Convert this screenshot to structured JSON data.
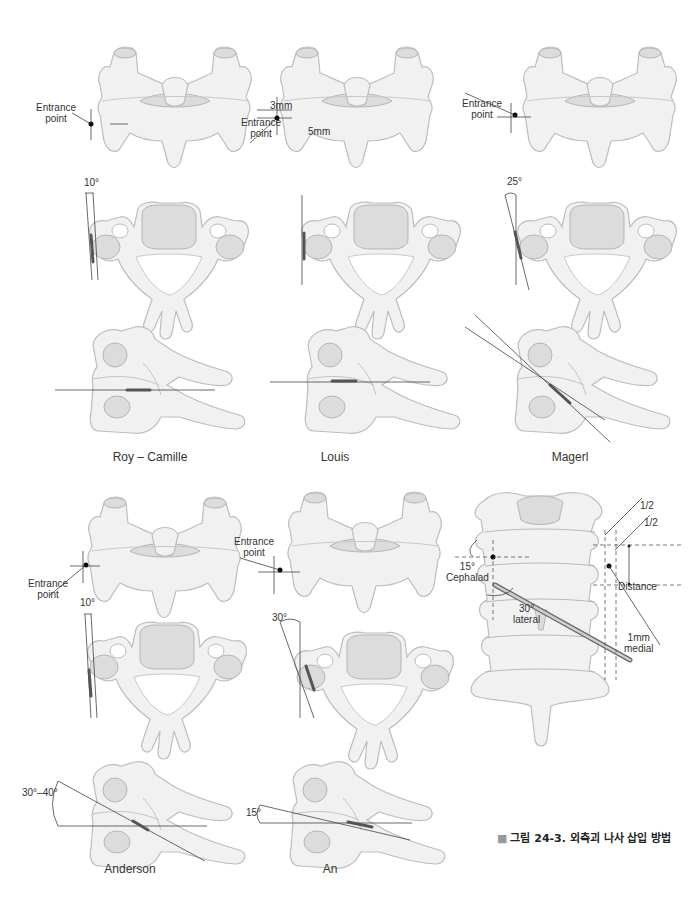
{
  "figure": {
    "caption_marker": "■",
    "caption": "그림 24-3. 외측괴 나사 삽입 방법",
    "colors": {
      "bone": "#f1f1f1",
      "bone_shadow": "#dcdcdc",
      "line": "#444444",
      "caption_marker": "#9a9a9a"
    }
  },
  "techniques": [
    {
      "name": "Roy – Camille",
      "posterior_view": {
        "label": "Entrance point",
        "line1": "Entrance",
        "line2": "point"
      },
      "axial_view": {
        "angle": "10°"
      },
      "lateral_view": {
        "angle": ""
      }
    },
    {
      "name": "Louis",
      "posterior_view": {
        "line1": "Entrance",
        "line2": "point",
        "offset_vertical": "3mm",
        "offset_horizontal": "5mm"
      },
      "axial_view": {
        "angle": ""
      },
      "lateral_view": {
        "angle": ""
      }
    },
    {
      "name": "Magerl",
      "posterior_view": {
        "line1": "Entrance",
        "line2": "point"
      },
      "axial_view": {
        "angle": "25°"
      },
      "lateral_view": {
        "angle": ""
      }
    },
    {
      "name": "Anderson",
      "posterior_view": {
        "line1": "Entrance",
        "line2": "point"
      },
      "axial_view": {
        "angle": "10°"
      },
      "lateral_view": {
        "angle": "30°–40°"
      }
    },
    {
      "name": "An",
      "posterior_view": {
        "line1": "Entrance",
        "line2": "point"
      },
      "axial_view": {
        "angle": "30°"
      },
      "lateral_view": {
        "angle": "15°"
      }
    }
  ],
  "spine_detail": {
    "half_top": "1/2",
    "half_bottom": "1/2",
    "cephalad_angle": "15°",
    "cephalad_label": "Cephalad",
    "lateral_angle": "30°",
    "lateral_label": "lateral",
    "distance_label": "Distance",
    "medial_value": "1mm",
    "medial_label": "medial"
  }
}
